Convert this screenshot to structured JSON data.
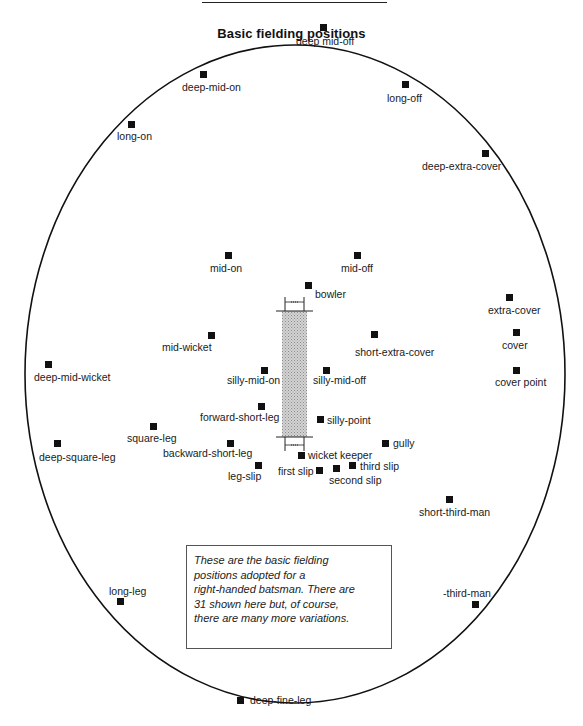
{
  "title": "Basic fielding positions",
  "note": {
    "lines": [
      "These are the basic fielding",
      "positions adopted for a",
      "right-handed batsman. There are",
      "31 shown here but, of course,",
      "there are many more variations."
    ]
  },
  "field": {
    "boundary": {
      "cx": 295,
      "cy": 374,
      "rx": 270,
      "ry": 329
    },
    "pitch": {
      "x": 282,
      "top": 311,
      "bottom": 437,
      "width": 25
    }
  },
  "positions": [
    {
      "name": "deep mid-off",
      "mx": 320,
      "my": 24,
      "lx": 296,
      "ly": 35
    },
    {
      "name": "deep-mid-on",
      "mx": 200,
      "my": 71,
      "lx": 182,
      "ly": 81
    },
    {
      "name": "long-off",
      "mx": 402,
      "my": 81,
      "lx": 387,
      "ly": 92
    },
    {
      "name": "long-on",
      "mx": 128,
      "my": 121,
      "lx": 117,
      "ly": 130
    },
    {
      "name": "deep-extra-cover",
      "mx": 482,
      "my": 150,
      "lx": 422,
      "ly": 160
    },
    {
      "name": "mid-on",
      "mx": 225,
      "my": 252,
      "lx": 210,
      "ly": 262
    },
    {
      "name": "mid-off",
      "mx": 354,
      "my": 252,
      "lx": 341,
      "ly": 262
    },
    {
      "name": "bowler",
      "mx": 305,
      "my": 282,
      "lx": 315,
      "ly": 288
    },
    {
      "name": "extra-cover",
      "mx": 506,
      "my": 294,
      "lx": 488,
      "ly": 304
    },
    {
      "name": "mid-wicket",
      "mx": 208,
      "my": 332,
      "lx": 162,
      "ly": 341
    },
    {
      "name": "cover",
      "mx": 513,
      "my": 329,
      "lx": 502,
      "ly": 339
    },
    {
      "name": "short-extra-cover",
      "mx": 371,
      "my": 331,
      "lx": 355,
      "ly": 346
    },
    {
      "name": "deep-mid-wicket",
      "mx": 45,
      "my": 361,
      "lx": 34,
      "ly": 371
    },
    {
      "name": "silly-mid-on",
      "mx": 261,
      "my": 367,
      "lx": 227,
      "ly": 374
    },
    {
      "name": "silly-mid-off",
      "mx": 323,
      "my": 367,
      "lx": 313,
      "ly": 374
    },
    {
      "name": "cover point",
      "mx": 513,
      "my": 367,
      "lx": 495,
      "ly": 376
    },
    {
      "name": "forward-short-leg",
      "mx": 258,
      "my": 403,
      "lx": 200,
      "ly": 411
    },
    {
      "name": "silly-point",
      "mx": 317,
      "my": 416,
      "lx": 327,
      "ly": 414
    },
    {
      "name": "square-leg",
      "mx": 150,
      "my": 423,
      "lx": 127,
      "ly": 432
    },
    {
      "name": "deep-square-leg",
      "mx": 54,
      "my": 440,
      "lx": 39,
      "ly": 451
    },
    {
      "name": "backward-short-leg",
      "mx": 227,
      "my": 440,
      "lx": 163,
      "ly": 447
    },
    {
      "name": "gully",
      "mx": 382,
      "my": 440,
      "lx": 393,
      "ly": 437
    },
    {
      "name": "wicket keeper",
      "mx": 298,
      "my": 452,
      "lx": 308,
      "ly": 449
    },
    {
      "name": "leg-slip",
      "mx": 255,
      "my": 462,
      "lx": 228,
      "ly": 470
    },
    {
      "name": "third slip",
      "mx": 349,
      "my": 462,
      "lx": 360,
      "ly": 460
    },
    {
      "name": "first slip",
      "mx": 316,
      "my": 467,
      "lx": 278,
      "ly": 465
    },
    {
      "name": "second slip",
      "mx": 333,
      "my": 465,
      "lx": 329,
      "ly": 474
    },
    {
      "name": "short-third-man",
      "mx": 446,
      "my": 496,
      "lx": 419,
      "ly": 506
    },
    {
      "name": "long-leg",
      "mx": 117,
      "my": 598,
      "lx": 109,
      "ly": 585
    },
    {
      "name": "-third-man",
      "mx": 472,
      "my": 601,
      "lx": 443,
      "ly": 587
    },
    {
      "name": "deep-fine-leg",
      "mx": 237,
      "my": 697,
      "lx": 250,
      "ly": 694
    }
  ]
}
